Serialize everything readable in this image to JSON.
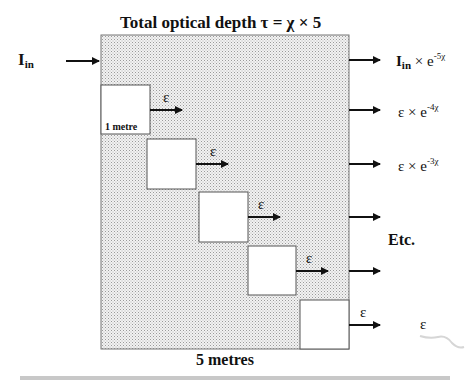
{
  "diagram": {
    "title": "Total optical depth τ = χ × 5",
    "input_label": "I",
    "input_sub": "in",
    "slab_count": 5,
    "unit_cell_label": "1 metre",
    "bottom_label": "5 metres",
    "emission_symbol": "ε",
    "outputs": [
      {
        "base": "I",
        "sub": "in",
        "op": " × e",
        "exp": "-5χ"
      },
      {
        "base": "ε",
        "sub": "",
        "op": " × e",
        "exp": "-4χ"
      },
      {
        "base": "ε",
        "sub": "",
        "op": " × e",
        "exp": "-3χ"
      },
      {
        "base": "",
        "sub": "",
        "op": "",
        "exp": ""
      },
      {
        "base": "",
        "sub": "",
        "op": "",
        "exp": ""
      },
      {
        "base": "ε",
        "sub": "",
        "op": "",
        "exp": ""
      }
    ],
    "etc_label": "Etc.",
    "colors": {
      "slab_fill": "#e2e2e2",
      "stroke": "#111111",
      "cell_fill": "#ffffff"
    }
  }
}
